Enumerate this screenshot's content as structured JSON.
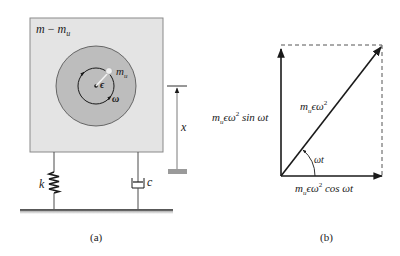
{
  "panel_a": {
    "caption": "(a)",
    "mass_label": {
      "m": "m",
      "minus": " − ",
      "mu_base": "m",
      "mu_sub": "u"
    },
    "rotor": {
      "unbalanced_mass_base": "m",
      "unbalanced_mass_sub": "u",
      "eccentricity": "ϵ",
      "angular_velocity": "ω"
    },
    "spring_label": "k",
    "damper_label": "c",
    "displacement_label": "x"
  },
  "panel_b": {
    "caption": "(b)",
    "resultant": {
      "base": "m",
      "sub": "u",
      "mid": "ϵω",
      "sup": "2"
    },
    "vertical": {
      "base": "m",
      "sub": "u",
      "mid": "ϵω",
      "sup": "2",
      "tail": " sin ωt"
    },
    "horizontal": {
      "base": "m",
      "sub": "u",
      "mid": "ϵω",
      "sup": "2",
      "tail": " cos ωt"
    },
    "angle": "ωt"
  },
  "colors": {
    "box_fill": "#e4e4e4",
    "disk_fill": "#bdbdbd",
    "line": "#1a1a1a",
    "ground": "#9a9a9a"
  }
}
